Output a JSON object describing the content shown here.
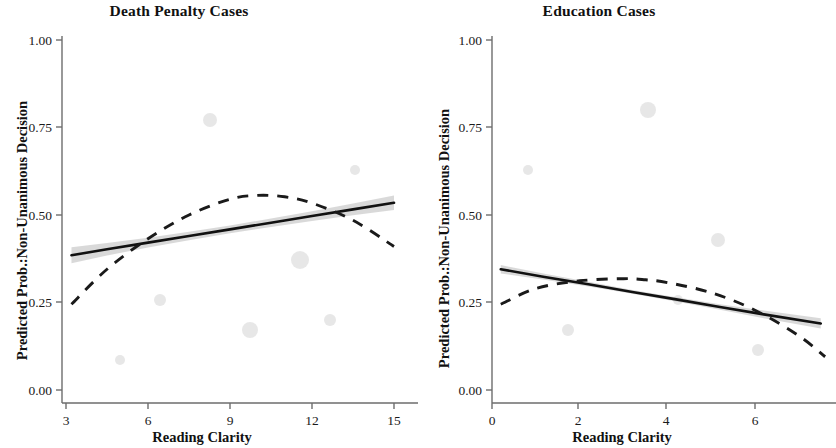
{
  "figure": {
    "background": "#ffffff",
    "line_color": "#111111",
    "band_color": "#b9b9b9"
  },
  "panels": [
    {
      "id": "death-penalty",
      "title": "Death Penalty Cases",
      "xlabel": "Reading Clarity",
      "ylabel": "Predicted Prob.:Non-Unanimous Decision",
      "xticks": [
        "3",
        "6",
        "9",
        "12",
        "15"
      ],
      "yticks": [
        "0.00",
        "0.25",
        "0.50",
        "0.75",
        "1.00"
      ]
    },
    {
      "id": "education",
      "title": "Education Cases",
      "xlabel": "Reading Clarity",
      "ylabel": "Predicted Prob.:Non-Unanimous Decision",
      "xticks": [
        "0",
        "2",
        "4",
        "6"
      ],
      "yticks": [
        "0.00",
        "0.25",
        "0.50",
        "0.75",
        "1.00"
      ]
    }
  ],
  "chart_data": [
    {
      "type": "line",
      "panel": "Death Penalty Cases",
      "title": "Death Penalty Cases",
      "xlabel": "Reading Clarity",
      "ylabel": "Predicted Prob.:Non-Unanimous Decision",
      "xlim": [
        2.6,
        15.4
      ],
      "ylim": [
        0.0,
        1.0
      ],
      "xtick_values": [
        3,
        6,
        9,
        12,
        15
      ],
      "ytick_values": [
        0.0,
        0.25,
        0.5,
        0.75,
        1.0
      ],
      "grid": false,
      "legend": "none",
      "series": [
        {
          "name": "linear-fit",
          "style": "solid",
          "color": "#111111",
          "x": [
            3.2,
            4.5,
            6.0,
            7.5,
            9.0,
            10.5,
            12.0,
            13.5,
            15.0
          ],
          "y": [
            0.385,
            0.402,
            0.421,
            0.44,
            0.459,
            0.478,
            0.497,
            0.516,
            0.535
          ],
          "ci_lower": [
            0.362,
            0.384,
            0.407,
            0.428,
            0.448,
            0.466,
            0.483,
            0.499,
            0.514
          ],
          "ci_upper": [
            0.408,
            0.42,
            0.435,
            0.452,
            0.47,
            0.49,
            0.511,
            0.533,
            0.556
          ]
        },
        {
          "name": "quadratic-fit",
          "style": "dashed",
          "color": "#1a1a1a",
          "x": [
            3.2,
            4.5,
            6.0,
            7.5,
            9.0,
            10.0,
            11.0,
            12.0,
            13.5,
            15.0
          ],
          "y": [
            0.245,
            0.345,
            0.432,
            0.5,
            0.545,
            0.556,
            0.552,
            0.534,
            0.485,
            0.41
          ]
        }
      ]
    },
    {
      "type": "line",
      "panel": "Education Cases",
      "title": "Education Cases",
      "xlabel": "Reading Clarity",
      "ylabel": "Predicted Prob.:Non-Unanimous Decision",
      "xlim": [
        -0.45,
        7.9
      ],
      "ylim": [
        0.0,
        1.0
      ],
      "xtick_values": [
        0,
        2,
        4,
        6
      ],
      "ytick_values": [
        0.0,
        0.25,
        0.5,
        0.75,
        1.0
      ],
      "grid": false,
      "legend": "none",
      "series": [
        {
          "name": "linear-fit",
          "style": "solid",
          "color": "#111111",
          "x": [
            0.2,
            1.2,
            2.2,
            3.2,
            4.2,
            5.2,
            6.2,
            7.5
          ],
          "y": [
            0.345,
            0.323,
            0.302,
            0.28,
            0.259,
            0.237,
            0.216,
            0.19
          ],
          "ci_lower": [
            0.333,
            0.315,
            0.296,
            0.275,
            0.253,
            0.229,
            0.205,
            0.176
          ],
          "ci_upper": [
            0.357,
            0.332,
            0.309,
            0.286,
            0.265,
            0.245,
            0.227,
            0.205
          ]
        },
        {
          "name": "quadratic-fit",
          "style": "dashed",
          "color": "#1a1a1a",
          "x": [
            0.2,
            1.0,
            2.0,
            3.0,
            3.5,
            4.0,
            5.0,
            6.0,
            7.0,
            7.6
          ],
          "y": [
            0.245,
            0.29,
            0.312,
            0.318,
            0.315,
            0.307,
            0.278,
            0.228,
            0.155,
            0.095
          ]
        }
      ]
    }
  ]
}
